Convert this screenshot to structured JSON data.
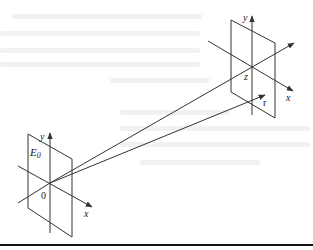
{
  "diagram": {
    "type": "geometric-optics-projection",
    "background_text": "illegible show-through text",
    "source_plane": {
      "name": "E0",
      "label_main": "E",
      "label_sub": "0",
      "origin_label": "0",
      "x_axis_label": "x",
      "y_axis_label": "y"
    },
    "target_plane": {
      "origin_label": "z",
      "x_axis_label": "x",
      "y_axis_label": "y",
      "vector_label": "r"
    },
    "rays": [
      {
        "from": "source origin",
        "to": "target origin z"
      },
      {
        "from": "source origin",
        "to": "point r"
      }
    ],
    "colors": {
      "line": "#333333",
      "text": "#222222",
      "ghost_text": "#f2f2f2",
      "rule": "#111111"
    }
  }
}
